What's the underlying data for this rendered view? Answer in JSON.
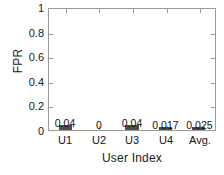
{
  "chart_data": {
    "type": "bar",
    "title": "",
    "xlabel": "User Index",
    "ylabel": "FPR",
    "categories": [
      "U1",
      "U2",
      "U3",
      "U4",
      "Avg."
    ],
    "values": [
      0.04,
      0,
      0.04,
      0.017,
      0.025
    ],
    "value_labels": [
      "0.04",
      "0",
      "0.04",
      "0.017",
      "0.025"
    ],
    "ylim": [
      0,
      1
    ],
    "yticks": [
      0,
      0.2,
      0.4,
      0.6,
      0.8,
      1
    ],
    "ytick_labels": [
      "0",
      "0.2",
      "0.4",
      "0.6",
      "0.8",
      "1"
    ],
    "grid": false,
    "legend": null,
    "bar_color": "#4d4d4d",
    "axis_color": "#9a9a9a",
    "background_color": "#ffffff"
  }
}
